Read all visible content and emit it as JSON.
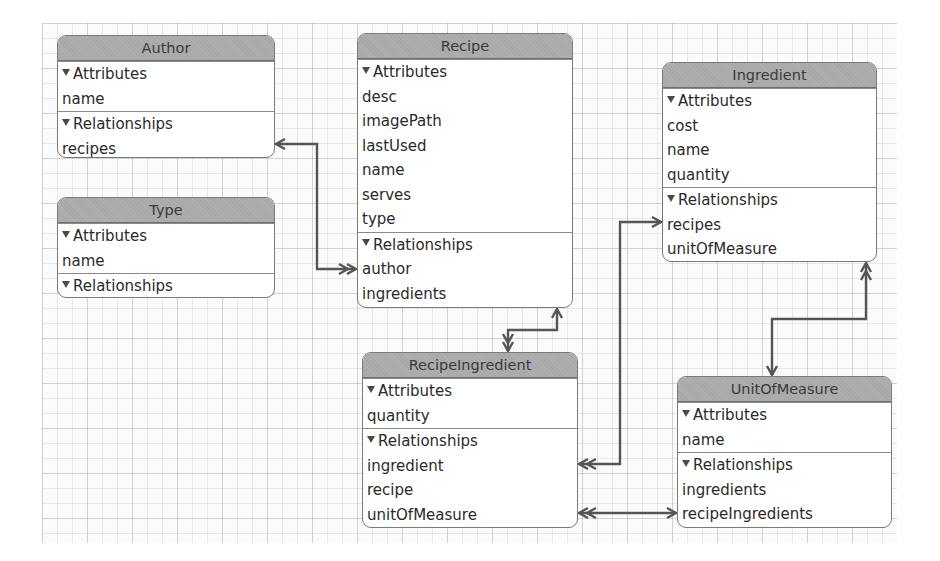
{
  "diagram": {
    "type": "Core Data entity relationship model",
    "colors": {
      "header_fill": "#a9a9a9",
      "box_border": "#7a7a7a",
      "connector": "#555555",
      "grid": "#e0e0e0"
    }
  },
  "entities": {
    "author": {
      "name": "Author",
      "attributes_label": "Attributes",
      "attributes": [
        "name"
      ],
      "relationships_label": "Relationships",
      "relationships": [
        "recipes"
      ]
    },
    "type": {
      "name": "Type",
      "attributes_label": "Attributes",
      "attributes": [
        "name"
      ],
      "relationships_label": "Relationships",
      "relationships": []
    },
    "recipe": {
      "name": "Recipe",
      "attributes_label": "Attributes",
      "attributes": [
        "desc",
        "imagePath",
        "lastUsed",
        "name",
        "serves",
        "type"
      ],
      "relationships_label": "Relationships",
      "relationships": [
        "author",
        "ingredients"
      ]
    },
    "ingredient": {
      "name": "Ingredient",
      "attributes_label": "Attributes",
      "attributes": [
        "cost",
        "name",
        "quantity"
      ],
      "relationships_label": "Relationships",
      "relationships": [
        "recipes",
        "unitOfMeasure"
      ]
    },
    "recipeIngredient": {
      "name": "RecipeIngredient",
      "attributes_label": "Attributes",
      "attributes": [
        "quantity"
      ],
      "relationships_label": "Relationships",
      "relationships": [
        "ingredient",
        "recipe",
        "unitOfMeasure"
      ]
    },
    "unitOfMeasure": {
      "name": "UnitOfMeasure",
      "attributes_label": "Attributes",
      "attributes": [
        "name"
      ],
      "relationships_label": "Relationships",
      "relationships": [
        "ingredients",
        "recipeIngredients"
      ]
    }
  },
  "relationships": [
    {
      "from": "Author.recipes",
      "to": "Recipe.author",
      "from_end": "to-one",
      "to_end": "to-many"
    },
    {
      "from": "Recipe.ingredients",
      "to": "RecipeIngredient",
      "from_end": "to-one",
      "to_end": "to-many"
    },
    {
      "from": "Ingredient.recipes",
      "to": "RecipeIngredient.ingredient",
      "from_end": "to-one",
      "to_end": "to-many"
    },
    {
      "from": "Ingredient.unitOfMeasure",
      "to": "UnitOfMeasure",
      "from_end": "to-many",
      "to_end": "to-one"
    },
    {
      "from": "RecipeIngredient.unitOfMeasure",
      "to": "UnitOfMeasure.recipeIngredients",
      "from_end": "to-many",
      "to_end": "to-one"
    }
  ]
}
